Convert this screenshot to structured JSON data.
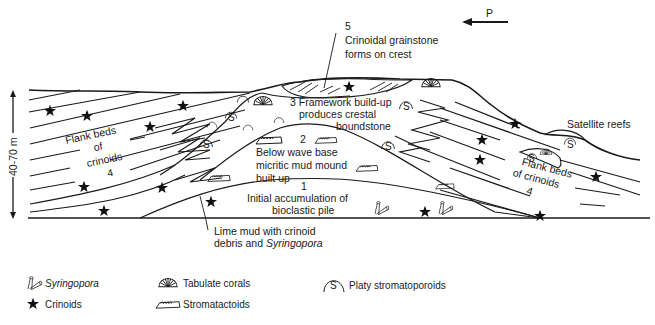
{
  "figure": {
    "paleocurrent_label": "P",
    "scale_label": "40-70 m"
  },
  "stages": [
    {
      "number": "1",
      "lines": [
        "Initial accumulation of",
        "bioclastic pile"
      ]
    },
    {
      "number": "2",
      "lines": [
        "Below wave base",
        "micritic mud mound",
        "built up"
      ]
    },
    {
      "number": "3",
      "lines": [
        "3 Framework build-up",
        "produces crestal",
        "boundstone"
      ]
    },
    {
      "number": "4",
      "left_lines": [
        "Flank beds",
        "of",
        "crinoids",
        "4"
      ],
      "right_lines": [
        "Flank beds",
        "of crinoids",
        "4"
      ]
    },
    {
      "number": "5",
      "lines": [
        "5",
        "Crinoidal grainstone",
        "forms on crest"
      ]
    }
  ],
  "annotations": {
    "satellite_reefs": "Satellite reefs",
    "lime_mud_line1": "Lime mud with crinoid",
    "lime_mud_line2_prefix": "debris and ",
    "lime_mud_line2_italic": "Syringopora"
  },
  "legend": {
    "items": [
      {
        "icon": "syringopora-icon",
        "label": "Syringopora",
        "italic": true
      },
      {
        "icon": "crinoid-star-icon",
        "label": "Crinoids",
        "italic": false
      },
      {
        "icon": "tabulate-coral-icon",
        "label": "Tabulate corals",
        "italic": false
      },
      {
        "icon": "stromatactoid-icon",
        "label": "Stromatactoids",
        "italic": false
      },
      {
        "icon": "stromatoporoid-icon",
        "label": "Platy stromatoporoids",
        "italic": false,
        "glyph": "S"
      }
    ]
  }
}
